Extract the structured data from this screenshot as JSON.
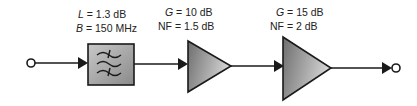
{
  "diagram": {
    "stages": [
      {
        "type": "filter",
        "labels": [
          {
            "var": "L",
            "text": " = 1.3 dB"
          },
          {
            "var": "B",
            "text": " = 150 MHz"
          }
        ]
      },
      {
        "type": "amplifier",
        "labels": [
          {
            "var": "G",
            "text": " = 10 dB"
          },
          {
            "var": "",
            "text": "NF = 1.5 dB"
          }
        ]
      },
      {
        "type": "amplifier",
        "labels": [
          {
            "var": "G",
            "text": " = 15 dB"
          },
          {
            "var": "",
            "text": "NF = 2 dB"
          }
        ]
      }
    ],
    "colors": {
      "line": "#1a1a1a",
      "fill_light": "#d0d0d0",
      "fill_dark": "#7a7a7a"
    }
  }
}
